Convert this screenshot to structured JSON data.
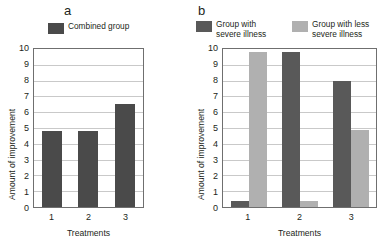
{
  "figure": {
    "panels": [
      {
        "letter": "a",
        "legend": [
          {
            "label": "Combined group",
            "color": "#4a4a4a"
          }
        ]
      },
      {
        "letter": "b",
        "legend": [
          {
            "label": "Group with\nsevere illness",
            "color": "#595959"
          },
          {
            "label": "Group with less\nsevere illness",
            "color": "#b0b0b0"
          }
        ]
      }
    ]
  },
  "chart_data": [
    {
      "type": "bar",
      "title": "a",
      "categories": [
        "1",
        "2",
        "3"
      ],
      "series": [
        {
          "name": "Combined group",
          "color": "#4a4a4a",
          "values": [
            4.8,
            4.8,
            6.5
          ]
        }
      ],
      "xlabel": "Treatments",
      "ylabel": "Amount of improvement",
      "ylim": [
        0,
        10
      ],
      "yticks": [
        0,
        1,
        2,
        3,
        4,
        5,
        6,
        7,
        8,
        9,
        10
      ],
      "grid": true,
      "legend_position": "above-plot"
    },
    {
      "type": "bar",
      "title": "b",
      "categories": [
        "1",
        "2",
        "3"
      ],
      "series": [
        {
          "name": "Group with severe illness",
          "color": "#595959",
          "values": [
            0.35,
            9.8,
            8.0
          ]
        },
        {
          "name": "Group with less severe illness",
          "color": "#b0b0b0",
          "values": [
            9.8,
            0.4,
            4.9
          ]
        }
      ],
      "xlabel": "Treatments",
      "ylabel": "Amount of improvement",
      "ylim": [
        0,
        10
      ],
      "yticks": [
        0,
        1,
        2,
        3,
        4,
        5,
        6,
        7,
        8,
        9,
        10
      ],
      "grid": true,
      "legend_position": "above-plot"
    }
  ]
}
